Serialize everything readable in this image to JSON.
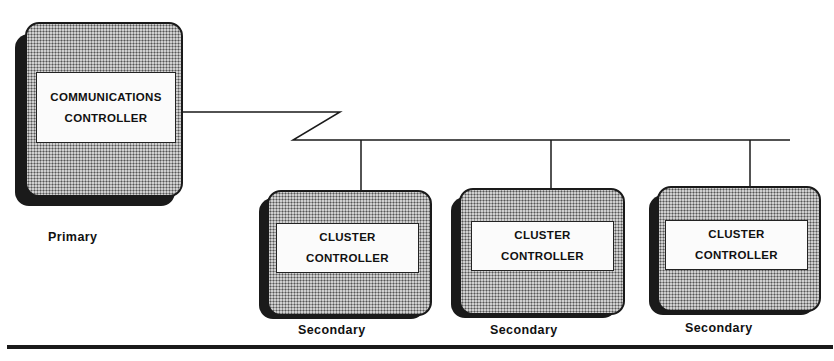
{
  "diagram": {
    "type": "network-topology",
    "primary": {
      "name": "COMMUNICATIONS CONTROLLER",
      "line1": "COMMUNICATIONS",
      "line2": "CONTROLLER",
      "role": "Primary"
    },
    "link": {
      "style": "communications line (zigzag)",
      "color": "#1a1a1a"
    },
    "secondaries": [
      {
        "line1": "CLUSTER",
        "line2": "CONTROLLER",
        "role": "Secondary"
      },
      {
        "line1": "CLUSTER",
        "line2": "CONTROLLER",
        "role": "Secondary"
      },
      {
        "line1": "CLUSTER",
        "line2": "CONTROLLER",
        "role": "Secondary"
      }
    ],
    "colors": {
      "ink": "#1a1a1a",
      "fill_pattern": "#cfcfcf",
      "label_bg": "#fbfbfb",
      "background": "#ffffff"
    }
  }
}
